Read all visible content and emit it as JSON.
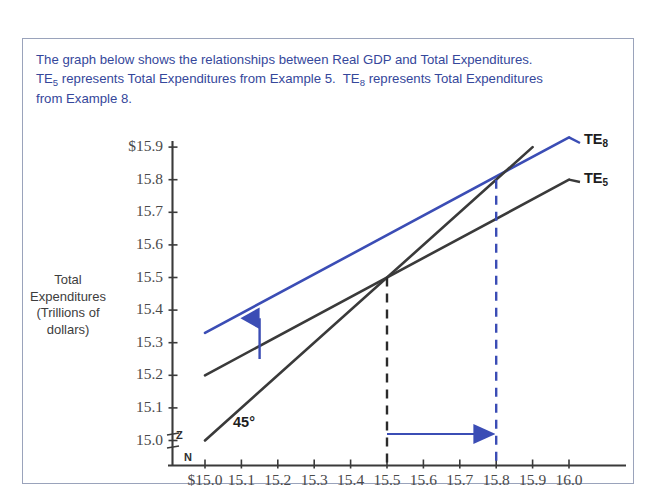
{
  "caption": {
    "line1": "The graph below shows the relationships between Real GDP and Total Expenditures.",
    "line2_a": "TE",
    "line2_sub_a": "5",
    "line2_b": " represents Total Expenditures from Example 5.  TE",
    "line2_sub_b": "8",
    "line2_c": " represents Total Expenditures",
    "line3": "from Example 8.",
    "color": "#35479b"
  },
  "axis_labels": {
    "y_title_line1": "Total",
    "y_title_line2": "Expenditures",
    "y_title_line3": "(Trillions of",
    "y_title_line4": "dollars)",
    "break_top": "Z",
    "break_bottom": "N"
  },
  "series_labels": {
    "te8_text": "TE",
    "te8_sub": "8",
    "te5_text": "TE",
    "te5_sub": "5",
    "line45": "45°"
  },
  "colors": {
    "te8_blue": "#3b4db5",
    "te5_dark": "#3a3a3a",
    "line45_dark": "#3a3a3a",
    "axis": "#3a3a3a",
    "caption_blue": "#35479b",
    "panel_border": "#9aa3bb",
    "dashed_black": "#2b2b2b",
    "dashed_blue": "#3b4db5"
  },
  "chart_data": {
    "type": "line",
    "title": "",
    "xlabel": "Real GDP (Trillions of dollars)",
    "ylabel": "Total Expenditures (Trillions of dollars)",
    "xlim": [
      15.0,
      16.0
    ],
    "ylim": [
      15.0,
      15.9
    ],
    "grid": false,
    "legend_position": "right-inline",
    "x_ticks": [
      "$15.0",
      "15.1",
      "15.2",
      "15.3",
      "15.4",
      "15.5",
      "15.6",
      "15.7",
      "15.8",
      "15.9",
      "16.0"
    ],
    "x_tick_values": [
      15.0,
      15.1,
      15.2,
      15.3,
      15.4,
      15.5,
      15.6,
      15.7,
      15.8,
      15.9,
      16.0
    ],
    "y_ticks": [
      "15.0",
      "15.1",
      "15.2",
      "15.3",
      "15.4",
      "15.5",
      "15.6",
      "15.7",
      "15.8",
      "$15.9"
    ],
    "y_tick_values": [
      15.0,
      15.1,
      15.2,
      15.3,
      15.4,
      15.5,
      15.6,
      15.7,
      15.8,
      15.9
    ],
    "series": [
      {
        "name": "TE8",
        "label": "TE8",
        "color": "#3b4db5",
        "points": [
          [
            15.0,
            15.33
          ],
          [
            16.0,
            15.93
          ]
        ],
        "slope": 0.6,
        "intercept_at_15": 15.33
      },
      {
        "name": "TE5",
        "label": "TE5",
        "color": "#3a3a3a",
        "points": [
          [
            15.0,
            15.2
          ],
          [
            16.0,
            15.8
          ]
        ],
        "slope": 0.6,
        "intercept_at_15": 15.2
      },
      {
        "name": "45-degree line",
        "label": "45°",
        "color": "#3a3a3a",
        "points": [
          [
            15.0,
            15.0
          ],
          [
            15.9,
            15.9
          ]
        ],
        "slope": 1.0,
        "intercept_at_15": 15.0
      }
    ],
    "annotations": [
      {
        "kind": "equilibrium",
        "label": "",
        "x": 15.5,
        "y": 15.5,
        "series": "TE5",
        "dashed_color": "#2b2b2b"
      },
      {
        "kind": "equilibrium",
        "label": "",
        "x": 15.8,
        "y": 15.8,
        "series": "TE8",
        "dashed_color": "#3b4db5"
      },
      {
        "kind": "shift-arrow-up",
        "x": 15.15,
        "from_y": 15.25,
        "to_y": 15.375,
        "color": "#3b4db5"
      },
      {
        "kind": "shift-arrow-right",
        "y": 15.02,
        "from_x": 15.5,
        "to_x": 15.8,
        "color": "#3b4db5"
      }
    ]
  }
}
